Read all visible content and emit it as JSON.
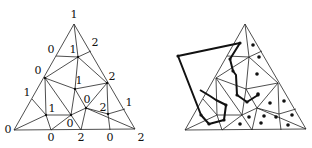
{
  "figure": {
    "left_panel": {
      "description": "Triangulated simplex with Sperner labeling",
      "labels": [
        {
          "text": "1",
          "x": 74,
          "y": 18
        },
        {
          "text": "0",
          "x": 51,
          "y": 53
        },
        {
          "text": "1",
          "x": 73,
          "y": 53
        },
        {
          "text": "2",
          "x": 95,
          "y": 46
        },
        {
          "text": "0",
          "x": 38,
          "y": 74
        },
        {
          "text": "1",
          "x": 79,
          "y": 84
        },
        {
          "text": "2",
          "x": 112,
          "y": 80
        },
        {
          "text": "1",
          "x": 27,
          "y": 96
        },
        {
          "text": "1",
          "x": 52,
          "y": 112
        },
        {
          "text": "0",
          "x": 87,
          "y": 103
        },
        {
          "text": "2",
          "x": 103,
          "y": 111
        },
        {
          "text": "1",
          "x": 129,
          "y": 106
        },
        {
          "text": "0",
          "x": 70,
          "y": 127
        },
        {
          "text": "0",
          "x": 8,
          "y": 133
        },
        {
          "text": "0",
          "x": 51,
          "y": 141
        },
        {
          "text": "2",
          "x": 81,
          "y": 141
        },
        {
          "text": "0",
          "x": 110,
          "y": 141
        },
        {
          "text": "2",
          "x": 141,
          "y": 141
        }
      ]
    },
    "right_panel": {
      "description": "Same triangulation with door-to-door walk paths and marked cells"
    }
  }
}
